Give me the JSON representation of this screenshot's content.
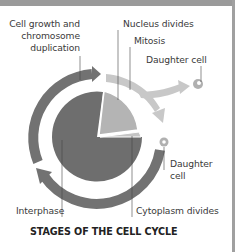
{
  "diagram": {
    "title": "STAGES OF THE CELL CYCLE",
    "labels": {
      "cell_growth_line1": "Cell growth and",
      "cell_growth_line2": "chromosome",
      "cell_growth_line3": "duplication",
      "nucleus_divides": "Nucleus divides",
      "mitosis": "Mitosis",
      "daughter_cell_top": "Daughter cell",
      "daughter_cell_right_line1": "Daughter",
      "daughter_cell_right_line2": "cell",
      "interphase": "Interphase",
      "cytoplasm_divides": "Cytoplasm divides"
    },
    "colors": {
      "interphase_dark": "#6e6e6e",
      "mitosis_light": "#b4b4b4",
      "cytokinesis_lighter": "#c4c4c4",
      "ring_dark": "#727272",
      "arrow_light": "#c8c8c8",
      "border": "#9a9a9a"
    }
  }
}
